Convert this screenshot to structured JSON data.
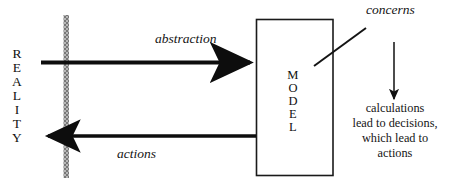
{
  "diagram": {
    "type": "concept-diagram",
    "nodes": {
      "reality": {
        "label": "REALITY",
        "letters": [
          "R",
          "E",
          "A",
          "L",
          "I",
          "T",
          "Y"
        ],
        "orientation": "vertical"
      },
      "model": {
        "label": "MODEL",
        "letters": [
          "M",
          "O",
          "D",
          "E",
          "L"
        ],
        "orientation": "vertical",
        "shape": "rectangle"
      }
    },
    "edges": [
      {
        "name": "abstraction",
        "label": "abstraction",
        "from": "reality",
        "to": "model",
        "direction": "right",
        "style": "italic"
      },
      {
        "name": "actions",
        "label": "actions",
        "from": "model",
        "to": "reality",
        "direction": "left",
        "style": "italic"
      }
    ],
    "annotations": {
      "concerns": {
        "label": "concerns",
        "style": "italic",
        "points_to": "model"
      },
      "outcome": {
        "lines": [
          "calculations",
          "lead to decisions,",
          "which lead to",
          "actions"
        ]
      }
    },
    "boundary": {
      "name": "reality-model-boundary",
      "orientation": "vertical",
      "style": "hatched-gray"
    },
    "colors": {
      "background": "#ffffff",
      "ink": "#111111",
      "arrow": "#0d0d0d",
      "boundary": "#8c8c8c",
      "box_stroke": "#1a1a1a"
    }
  }
}
